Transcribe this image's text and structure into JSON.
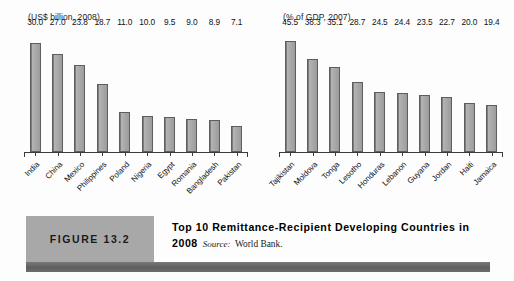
{
  "figure": {
    "tag_label": "FIGURE 13.2",
    "title": "Top 10 Remittance-Recipient Developing Countries in",
    "title_year": "2008",
    "source_label": "Source:",
    "source_value": "World Bank.",
    "accent_gray": "#a8a8a8",
    "rule_gray": "#6a6a6a",
    "bar_fill": "#9c9c9c",
    "bar_stroke": "#5e5e5e"
  },
  "chart_data": [
    {
      "type": "bar",
      "title": "(US$ billion, 2008)",
      "xlabel": "",
      "ylabel": "US$ billion",
      "ylim": [
        0,
        34
      ],
      "grid": false,
      "legend": "none",
      "categories": [
        "India",
        "China",
        "Mexico",
        "Philippines",
        "Poland",
        "Nigeria",
        "Egypt",
        "Romania",
        "Bangladesh",
        "Pakistan"
      ],
      "values": [
        30.0,
        27.0,
        23.8,
        18.7,
        11.0,
        10.0,
        9.5,
        9.0,
        8.9,
        7.1
      ],
      "value_labels": [
        "30.0",
        "27.0",
        "23.8",
        "18.7",
        "11.0",
        "10.0",
        "9.5",
        "9.0",
        "8.9",
        "7.1"
      ]
    },
    {
      "type": "bar",
      "title": "(% of GDP, 2007)",
      "xlabel": "",
      "ylabel": "% of GDP",
      "ylim": [
        0,
        51
      ],
      "grid": false,
      "legend": "none",
      "categories": [
        "Tajikistan",
        "Moldova",
        "Tonga",
        "Lesotho",
        "Honduras",
        "Lebanon",
        "Guyana",
        "Jordan",
        "Haiti",
        "Jamaica"
      ],
      "values": [
        45.5,
        38.3,
        35.1,
        28.7,
        24.5,
        24.4,
        23.5,
        22.7,
        20.0,
        19.4
      ],
      "value_labels": [
        "45.5",
        "38.3",
        "35.1",
        "28.7",
        "24.5",
        "24.4",
        "23.5",
        "22.7",
        "20.0",
        "19.4"
      ]
    }
  ]
}
